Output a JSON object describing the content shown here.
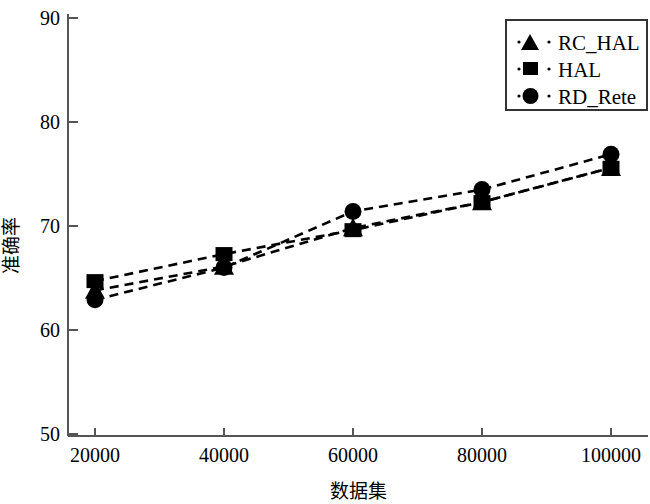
{
  "chart_data": {
    "type": "line",
    "title": "",
    "xlabel": "数据集",
    "ylabel": "准确率",
    "x": [
      20000,
      40000,
      60000,
      80000,
      100000
    ],
    "xtick_labels": [
      "20000",
      "40000",
      "60000",
      "80000",
      "100000"
    ],
    "ytick_labels": [
      "50",
      "60",
      "70",
      "80",
      "90"
    ],
    "yticks": [
      50,
      60,
      70,
      80,
      90
    ],
    "xlim": [
      20000,
      100000
    ],
    "ylim": [
      50,
      90
    ],
    "grid": false,
    "legend_position": "top-right",
    "line_style": "dashed",
    "color": "#000000",
    "series": [
      {
        "name": "RC_HAL",
        "marker": "triangle",
        "values": [
          63.8,
          66.1,
          69.8,
          72.3,
          75.6
        ]
      },
      {
        "name": "HAL",
        "marker": "square",
        "values": [
          64.7,
          67.3,
          69.6,
          72.3,
          75.6
        ]
      },
      {
        "name": "RD_Rete",
        "marker": "circle",
        "values": [
          62.9,
          66.0,
          71.4,
          73.5,
          76.9
        ]
      }
    ]
  },
  "legend": {
    "items": [
      {
        "label": "RC_HAL",
        "marker": "triangle-marker-icon"
      },
      {
        "label": "HAL",
        "marker": "square-marker-icon"
      },
      {
        "label": "RD_Rete",
        "marker": "circle-marker-icon"
      }
    ]
  },
  "axes": {
    "y_label": "准确率",
    "x_label": "数据集",
    "y_ticks": [
      "90",
      "80",
      "70",
      "60",
      "50"
    ],
    "x_ticks": [
      "20000",
      "40000",
      "60000",
      "80000",
      "100000"
    ]
  }
}
